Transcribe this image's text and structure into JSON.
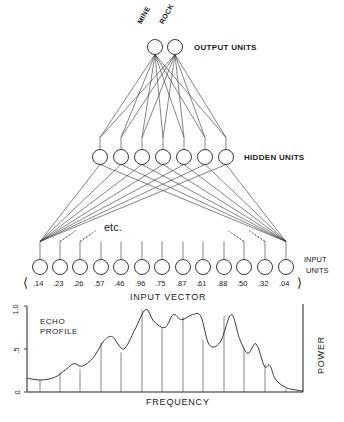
{
  "diagram": {
    "output_layer": {
      "label": "OUTPUT UNITS",
      "units": [
        {
          "name": "MINE",
          "x": 155,
          "y": 47
        },
        {
          "name": "ROCK",
          "x": 175,
          "y": 47
        }
      ]
    },
    "hidden_layer": {
      "label": "HIDDEN UNITS",
      "unit_count": 7,
      "xs": [
        100,
        121,
        142,
        163,
        184,
        205,
        226
      ],
      "y": 157
    },
    "input_layer": {
      "label_line1": "INPUT",
      "label_line2": "UNITS",
      "xs": [
        40,
        60,
        80,
        101,
        121,
        142,
        162,
        183,
        203,
        224,
        244,
        265,
        286
      ],
      "y": 267,
      "etc_label": "etc.",
      "vector_label": "INPUT VECTOR",
      "vector_open": "⟨",
      "vector_close": "⟩",
      "values": [
        ".14",
        ".23",
        ".26",
        ".57",
        ".46",
        ".96",
        ".75",
        ".87",
        ".61",
        ".88",
        ".50",
        ".32",
        ".04"
      ]
    }
  },
  "chart_data": {
    "type": "line",
    "title_line1": "ECHO",
    "title_line2": "PROFILE",
    "xlabel": "FREQUENCY",
    "ylabel": "POWER",
    "ylim": [
      0,
      1.0
    ],
    "yticks": [
      "0",
      ".5",
      "1.0"
    ],
    "sample_values": [
      0.14,
      0.23,
      0.26,
      0.57,
      0.46,
      0.96,
      0.75,
      0.87,
      0.61,
      0.88,
      0.5,
      0.32,
      0.04
    ],
    "curve": [
      [
        0,
        0.16
      ],
      [
        0.05,
        0.14
      ],
      [
        0.1,
        0.17
      ],
      [
        0.14,
        0.26
      ],
      [
        0.17,
        0.33
      ],
      [
        0.2,
        0.3
      ],
      [
        0.24,
        0.4
      ],
      [
        0.28,
        0.6
      ],
      [
        0.31,
        0.64
      ],
      [
        0.35,
        0.5
      ],
      [
        0.39,
        0.72
      ],
      [
        0.43,
        0.96
      ],
      [
        0.46,
        0.82
      ],
      [
        0.5,
        0.75
      ],
      [
        0.53,
        0.9
      ],
      [
        0.56,
        0.84
      ],
      [
        0.6,
        0.9
      ],
      [
        0.63,
        0.88
      ],
      [
        0.66,
        0.55
      ],
      [
        0.7,
        0.58
      ],
      [
        0.74,
        0.9
      ],
      [
        0.77,
        0.62
      ],
      [
        0.8,
        0.45
      ],
      [
        0.83,
        0.56
      ],
      [
        0.86,
        0.3
      ],
      [
        0.88,
        0.31
      ],
      [
        0.9,
        0.15
      ],
      [
        0.94,
        0.05
      ],
      [
        1.0,
        0.01
      ]
    ]
  }
}
